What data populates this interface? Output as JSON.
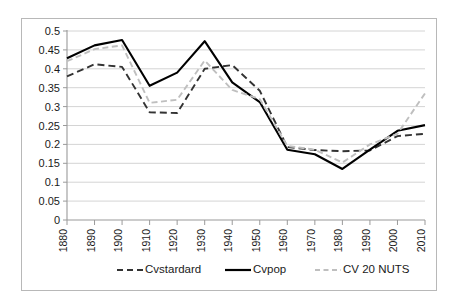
{
  "chart_data": {
    "type": "line",
    "title": "",
    "subtitle": "",
    "xlabel": "",
    "ylabel": "",
    "grid": "horizontal",
    "legend_position": "bottom",
    "ylim": [
      0,
      0.5
    ],
    "yticks": [
      "0",
      "0.05",
      "0.1",
      "0.15",
      "0.2",
      "0.25",
      "0.3",
      "0.35",
      "0.4",
      "0.45",
      "0.5"
    ],
    "ytick_values": [
      0,
      0.05,
      0.1,
      0.15,
      0.2,
      0.25,
      0.3,
      0.35,
      0.4,
      0.45,
      0.5
    ],
    "categories": [
      "1880",
      "1890",
      "1900",
      "1910",
      "1920",
      "1930",
      "1940",
      "1950",
      "1960",
      "1970",
      "1980",
      "1990",
      "2000",
      "2010"
    ],
    "x": [
      1880,
      1890,
      1900,
      1910,
      1920,
      1930,
      1940,
      1950,
      1960,
      1970,
      1980,
      1990,
      2000,
      2010
    ],
    "series": [
      {
        "name": "Cvstardard",
        "style": "dashed",
        "color": "#333333",
        "values": [
          0.38,
          0.412,
          0.405,
          0.285,
          0.283,
          0.4,
          0.41,
          0.342,
          0.193,
          0.185,
          0.182,
          0.184,
          0.222,
          0.228
        ]
      },
      {
        "name": "Cvpop",
        "style": "solid",
        "color": "#000000",
        "values": [
          0.428,
          0.462,
          0.476,
          0.355,
          0.39,
          0.473,
          0.364,
          0.312,
          0.186,
          0.174,
          0.135,
          0.186,
          0.236,
          0.251
        ]
      },
      {
        "name": "CV 20 NUTS",
        "style": "dashed",
        "color": "#bfbfbf",
        "values": [
          0.42,
          0.452,
          0.462,
          0.31,
          0.318,
          0.422,
          0.344,
          0.32,
          0.196,
          0.186,
          0.152,
          0.2,
          0.228,
          0.335
        ]
      }
    ]
  },
  "legend": {
    "items": [
      {
        "label": "Cvstardard"
      },
      {
        "label": "Cvpop"
      },
      {
        "label": "CV 20 NUTS"
      }
    ]
  }
}
